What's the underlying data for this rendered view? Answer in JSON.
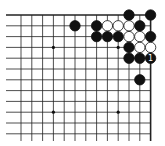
{
  "board": {
    "origin_x": 21,
    "origin_y": 15,
    "spacing": 10.8,
    "cols": 13,
    "rows": 12,
    "top_edge": true,
    "right_edge": true,
    "star_points": [
      [
        3,
        3
      ],
      [
        9,
        3
      ],
      [
        3,
        9
      ],
      [
        9,
        9
      ]
    ],
    "stones": [
      {
        "c": 10,
        "r": 0,
        "color": "black"
      },
      {
        "c": 12,
        "r": 0,
        "color": "black"
      },
      {
        "c": 5,
        "r": 1,
        "color": "black"
      },
      {
        "c": 7,
        "r": 1,
        "color": "black"
      },
      {
        "c": 8,
        "r": 1,
        "color": "white"
      },
      {
        "c": 9,
        "r": 1,
        "color": "white"
      },
      {
        "c": 10,
        "r": 1,
        "color": "white"
      },
      {
        "c": 11,
        "r": 1,
        "color": "black"
      },
      {
        "c": 7,
        "r": 2,
        "color": "black"
      },
      {
        "c": 8,
        "r": 2,
        "color": "black"
      },
      {
        "c": 9,
        "r": 2,
        "color": "black"
      },
      {
        "c": 10,
        "r": 2,
        "color": "white"
      },
      {
        "c": 11,
        "r": 2,
        "color": "white"
      },
      {
        "c": 12,
        "r": 2,
        "color": "black"
      },
      {
        "c": 10,
        "r": 3,
        "color": "black"
      },
      {
        "c": 11,
        "r": 3,
        "color": "white"
      },
      {
        "c": 12,
        "r": 3,
        "color": "white"
      },
      {
        "c": 10,
        "r": 4,
        "color": "black"
      },
      {
        "c": 11,
        "r": 4,
        "color": "black"
      },
      {
        "c": 12,
        "r": 4,
        "color": "black",
        "label": "1"
      },
      {
        "c": 11,
        "r": 6,
        "color": "black"
      }
    ]
  }
}
